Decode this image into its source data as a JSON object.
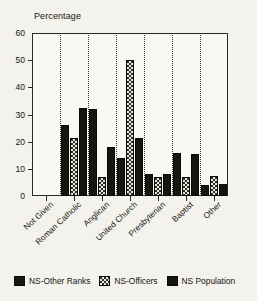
{
  "chart_data": {
    "type": "bar",
    "title": "Percentage",
    "xlabel": "",
    "ylabel": "Percentage",
    "ylim": [
      0,
      60
    ],
    "yticks": [
      0,
      10,
      20,
      30,
      40,
      50,
      60
    ],
    "grid": "vertical-dotted-separators",
    "legend_position": "bottom",
    "categories": [
      "Not Given",
      "Roman Catholic",
      "Anglican",
      "United Church",
      "Presbyterian",
      "Baptist",
      "Other"
    ],
    "series": [
      {
        "name": "NS-Other Ranks",
        "pattern": "solid-black",
        "color": "#17170f",
        "values": [
          0,
          26,
          32,
          14,
          8,
          16,
          4
        ]
      },
      {
        "name": "NS-Officers",
        "pattern": "checkered",
        "color": "#2f2f26",
        "values": [
          0,
          21.5,
          7,
          50,
          7,
          7,
          7.5
        ]
      },
      {
        "name": "NS Population",
        "pattern": "solid-dark",
        "color": "#141410",
        "values": [
          0,
          32.5,
          18,
          21.5,
          8,
          15.5,
          4.5
        ]
      }
    ]
  },
  "legend": {
    "items": [
      {
        "label": "NS-Other Ranks"
      },
      {
        "label": "NS-Officers"
      },
      {
        "label": "NS Population"
      }
    ]
  }
}
